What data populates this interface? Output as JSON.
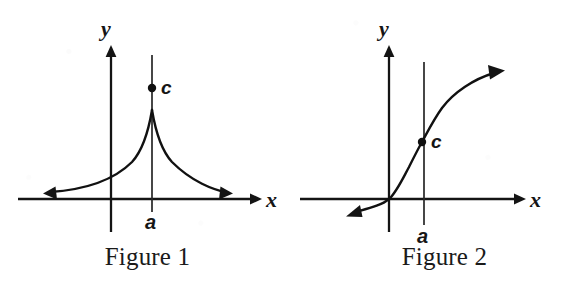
{
  "document": {
    "background_color": "#ffffff",
    "ink_color": "#141414",
    "type": "mathematics-textbook-figure-pair"
  },
  "figures": [
    {
      "id": "figure-1",
      "caption": "Figure 1",
      "axis_labels": {
        "x": "x",
        "y": "y"
      },
      "point_label": "c",
      "tick_label": "a",
      "description": "Cusp curve peaking at x = a with open point c above the cusp; both branches decay toward the x-axis with arrowheads pointing left and right.",
      "geometry": {
        "x_axis_y": 199,
        "y_axis_x": 111,
        "vertical_line_x": 152,
        "point_c": {
          "x": 152,
          "y": 88
        },
        "cusp_peak": {
          "x": 152,
          "y": 110
        },
        "left_arrow_tip": {
          "x": 43,
          "y": 193
        },
        "right_arrow_tip": {
          "x": 232,
          "y": 193
        },
        "x_axis_arrow_tip": {
          "x": 258,
          "y": 199
        },
        "y_axis_arrow_tip": {
          "x": 111,
          "y": 48
        }
      }
    },
    {
      "id": "figure-2",
      "caption": "Figure 2",
      "axis_labels": {
        "x": "x",
        "y": "y"
      },
      "point_label": "c",
      "tick_label": "a",
      "description": "Increasing S-shaped (cube-root style) curve passing through the origin and through the point c at x = a, with arrowheads at lower-left and upper-right.",
      "geometry": {
        "x_axis_y": 199,
        "y_axis_x": 389,
        "vertical_line_x": 424,
        "point_c": {
          "x": 422,
          "y": 142
        },
        "left_arrow_tip": {
          "x": 346,
          "y": 216
        },
        "curve_arrow_tip": {
          "x": 503,
          "y": 70
        },
        "x_axis_arrow_tip": {
          "x": 522,
          "y": 199
        },
        "y_axis_arrow_tip": {
          "x": 389,
          "y": 48
        }
      }
    }
  ]
}
